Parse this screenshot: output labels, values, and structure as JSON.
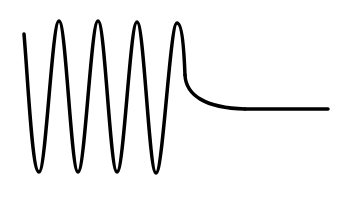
{
  "diagram": {
    "stroke_color": "#000000",
    "background_color": "#ffffff",
    "stroke_width": 3.5,
    "segments": [
      {
        "name": "oscillation",
        "cycles": 4
      },
      {
        "name": "decay"
      },
      {
        "name": "steady-state"
      }
    ]
  }
}
